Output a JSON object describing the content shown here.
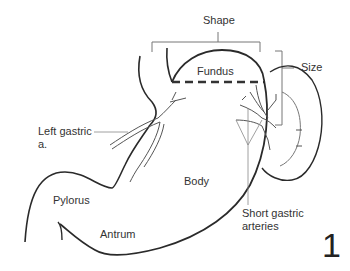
{
  "figure": {
    "number": "1",
    "labels": {
      "shape": "Shape",
      "fundus": "Fundus",
      "size": "Size",
      "left_gastric_line1": "Left gastric",
      "left_gastric_line2": "a.",
      "body": "Body",
      "pylorus": "Pylorus",
      "antrum": "Antrum",
      "short_gastric_line1": "Short gastric",
      "short_gastric_line2": "arteries"
    },
    "colors": {
      "line": "#2a2a2a",
      "vessel": "#555555",
      "text": "#333333"
    }
  }
}
